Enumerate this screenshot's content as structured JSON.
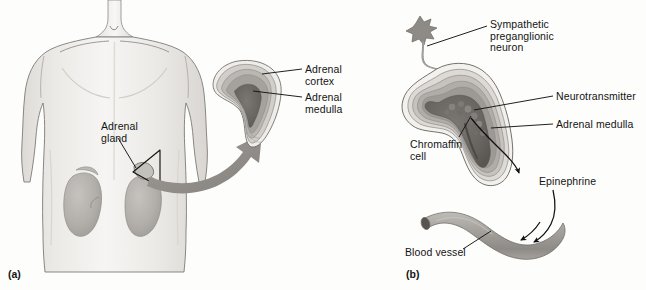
{
  "figure": {
    "background_color": "#fdfdfc",
    "ink_color": "#141414",
    "panels": [
      {
        "tag": "(a)",
        "tag_position": {
          "x": 8,
          "y": 268
        },
        "description": "Human torso showing location of the adrenal glands atop the kidneys, with a magnified cut-away of one adrenal gland."
      },
      {
        "tag": "(b)",
        "tag_position": {
          "x": 406,
          "y": 268
        },
        "description": "Magnified adrenal gland showing a sympathetic preganglionic neuron synapsing on chromaffin cells of the adrenal medulla, which release epinephrine into a blood vessel."
      }
    ]
  },
  "panel_a": {
    "tag": "(a)",
    "labels": [
      {
        "name": "adrenal-gland",
        "text": "Adrenal\ngland",
        "x": 101,
        "y": 121,
        "align": "left"
      },
      {
        "name": "adrenal-cortex",
        "text": "Adrenal\ncortex",
        "x": 305,
        "y": 64,
        "align": "left"
      },
      {
        "name": "adrenal-medulla",
        "text": "Adrenal\nmedulla",
        "x": 305,
        "y": 92,
        "align": "left"
      }
    ],
    "anatomy": [
      "torso",
      "left-kidney",
      "right-kidney",
      "adrenal-gland-in-situ",
      "magnification-arrow",
      "adrenal-gland-cutaway"
    ]
  },
  "panel_b": {
    "tag": "(b)",
    "labels": [
      {
        "name": "sympathetic-preganglionic-neuron",
        "text": "Sympathetic\npreganglionic\nneuron",
        "x": 490,
        "y": 19,
        "align": "left"
      },
      {
        "name": "neurotransmitter",
        "text": "Neurotransmitter",
        "x": 556,
        "y": 91,
        "align": "left"
      },
      {
        "name": "adrenal-medulla",
        "text": "Adrenal medulla",
        "x": 556,
        "y": 119,
        "align": "left"
      },
      {
        "name": "chromaffin-cell",
        "text": "Chromaffin\ncell",
        "x": 410,
        "y": 139,
        "align": "left"
      },
      {
        "name": "epinephrine",
        "text": "Epinephrine",
        "x": 539,
        "y": 176,
        "align": "left"
      },
      {
        "name": "blood-vessel",
        "text": "Blood vessel",
        "x": 405,
        "y": 247,
        "align": "left"
      }
    ],
    "anatomy": [
      "preganglionic-neuron-cell-body",
      "axon",
      "adrenal-gland-layers",
      "chromaffin-cell-mass",
      "epinephrine-secretion-arrow",
      "blood-vessel"
    ]
  },
  "colors": {
    "skin_light": "#f2f0ee",
    "skin_shadow": "#d6d3cf",
    "outline": "#7c7a77",
    "kidney": "#b4b2ae",
    "arrow_gray": "#8f8d89",
    "cortex_band_light": "#e6e4e0",
    "cortex_band_mid": "#c9c6c1",
    "cortex_band_dark": "#a7a49f",
    "medulla": "#6e6b67",
    "vessel": "#a3a09b",
    "label_line": "#1a1a1a"
  }
}
